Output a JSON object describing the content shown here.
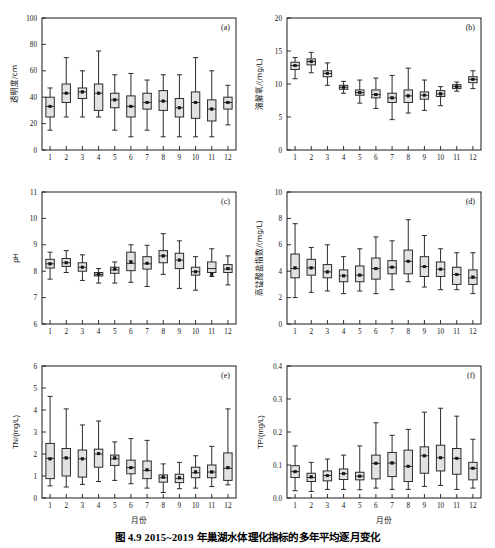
{
  "caption": "图 4.9   2015~2019 年巢湖水体理化指标的多年平均逐月变化",
  "common": {
    "xlabel": "月份",
    "categories": [
      "1",
      "2",
      "3",
      "4",
      "5",
      "6",
      "7",
      "8",
      "9",
      "10",
      "11",
      "12"
    ],
    "box_fill": "#e2e2e2",
    "box_stroke": "#2b2b2b",
    "mean_marker": "filled-square"
  },
  "chart_data": [
    {
      "type": "box",
      "panel": "(a)",
      "title": "",
      "xlabel": "月份",
      "ylabel": "透明度/cm",
      "ylim": [
        0,
        100
      ],
      "yticks": [
        0,
        20,
        40,
        60,
        80,
        100
      ],
      "grid": false,
      "categories": [
        "1",
        "2",
        "3",
        "4",
        "5",
        "6",
        "7",
        "8",
        "9",
        "10",
        "11",
        "12"
      ],
      "boxes": [
        {
          "month": "1",
          "whisker_low": 15,
          "q1": 25,
          "median": 33,
          "q3": 40,
          "whisker_high": 47,
          "mean": 33
        },
        {
          "month": "2",
          "whisker_low": 25,
          "q1": 36,
          "median": 43,
          "q3": 50,
          "whisker_high": 70,
          "mean": 43
        },
        {
          "month": "3",
          "whisker_low": 25,
          "q1": 39,
          "median": 44,
          "q3": 47,
          "whisker_high": 60,
          "mean": 44
        },
        {
          "month": "4",
          "whisker_low": 25,
          "q1": 30,
          "median": 43,
          "q3": 50,
          "whisker_high": 75,
          "mean": 43
        },
        {
          "month": "5",
          "whisker_low": 15,
          "q1": 32,
          "median": 38,
          "q3": 43,
          "whisker_high": 57,
          "mean": 38
        },
        {
          "month": "6",
          "whisker_low": 10,
          "q1": 25,
          "median": 33,
          "q3": 41,
          "whisker_high": 58,
          "mean": 33
        },
        {
          "month": "7",
          "whisker_low": 15,
          "q1": 31,
          "median": 36,
          "q3": 43,
          "whisker_high": 53,
          "mean": 36
        },
        {
          "month": "8",
          "whisker_low": 10,
          "q1": 30,
          "median": 37,
          "q3": 45,
          "whisker_high": 57,
          "mean": 37
        },
        {
          "month": "9",
          "whisker_low": 10,
          "q1": 25,
          "median": 32,
          "q3": 39,
          "whisker_high": 57,
          "mean": 32
        },
        {
          "month": "10",
          "whisker_low": 10,
          "q1": 24,
          "median": 36,
          "q3": 44,
          "whisker_high": 70,
          "mean": 36
        },
        {
          "month": "11",
          "whisker_low": 10,
          "q1": 22,
          "median": 31,
          "q3": 38,
          "whisker_high": 60,
          "mean": 31
        },
        {
          "month": "12",
          "whisker_low": 19,
          "q1": 31,
          "median": 36,
          "q3": 40,
          "whisker_high": 49,
          "mean": 36
        }
      ]
    },
    {
      "type": "box",
      "panel": "(b)",
      "title": "",
      "xlabel": "月份",
      "ylabel": "溶解氧/(mg/L)",
      "ylim": [
        0,
        20
      ],
      "yticks": [
        0,
        5,
        10,
        15,
        20
      ],
      "grid": false,
      "categories": [
        "1",
        "2",
        "3",
        "4",
        "5",
        "6",
        "7",
        "8",
        "9",
        "10",
        "11",
        "12"
      ],
      "boxes": [
        {
          "month": "1",
          "whisker_low": 10.8,
          "q1": 12.2,
          "median": 12.8,
          "q3": 13.3,
          "whisker_high": 14.0,
          "mean": 12.8
        },
        {
          "month": "2",
          "whisker_low": 11.7,
          "q1": 12.9,
          "median": 13.4,
          "q3": 13.8,
          "whisker_high": 14.8,
          "mean": 13.4
        },
        {
          "month": "3",
          "whisker_low": 9.8,
          "q1": 11.1,
          "median": 11.6,
          "q3": 12.0,
          "whisker_high": 13.2,
          "mean": 11.6
        },
        {
          "month": "4",
          "whisker_low": 8.6,
          "q1": 9.2,
          "median": 9.5,
          "q3": 9.8,
          "whisker_high": 10.4,
          "mean": 9.5
        },
        {
          "month": "5",
          "whisker_low": 7.1,
          "q1": 8.3,
          "median": 8.7,
          "q3": 9.1,
          "whisker_high": 10.6,
          "mean": 8.7
        },
        {
          "month": "6",
          "whisker_low": 6.3,
          "q1": 7.9,
          "median": 8.4,
          "q3": 9.1,
          "whisker_high": 10.9,
          "mean": 8.4
        },
        {
          "month": "7",
          "whisker_low": 4.6,
          "q1": 7.2,
          "median": 7.9,
          "q3": 8.6,
          "whisker_high": 11.3,
          "mean": 7.9
        },
        {
          "month": "8",
          "whisker_low": 5.6,
          "q1": 7.2,
          "median": 8.2,
          "q3": 9.1,
          "whisker_high": 12.4,
          "mean": 8.2
        },
        {
          "month": "9",
          "whisker_low": 6.0,
          "q1": 7.7,
          "median": 8.3,
          "q3": 8.8,
          "whisker_high": 10.6,
          "mean": 8.3
        },
        {
          "month": "10",
          "whisker_low": 6.7,
          "q1": 8.1,
          "median": 8.5,
          "q3": 9.0,
          "whisker_high": 9.6,
          "mean": 8.5
        },
        {
          "month": "11",
          "whisker_low": 8.9,
          "q1": 9.3,
          "median": 9.6,
          "q3": 9.9,
          "whisker_high": 10.3,
          "mean": 9.6
        },
        {
          "month": "12",
          "whisker_low": 9.3,
          "q1": 10.2,
          "median": 10.7,
          "q3": 11.1,
          "whisker_high": 12.0,
          "mean": 10.7
        }
      ]
    },
    {
      "type": "box",
      "panel": "(c)",
      "title": "",
      "xlabel": "月份",
      "ylabel": "pH",
      "ylim": [
        6,
        11
      ],
      "yticks": [
        6,
        7,
        8,
        9,
        10,
        11
      ],
      "grid": false,
      "categories": [
        "1",
        "2",
        "3",
        "4",
        "5",
        "6",
        "7",
        "8",
        "9",
        "10",
        "11",
        "12"
      ],
      "boxes": [
        {
          "month": "1",
          "whisker_low": 7.7,
          "q1": 8.12,
          "median": 8.28,
          "q3": 8.45,
          "whisker_high": 8.72,
          "mean": 8.28
        },
        {
          "month": "2",
          "whisker_low": 7.95,
          "q1": 8.18,
          "median": 8.32,
          "q3": 8.48,
          "whisker_high": 8.78,
          "mean": 8.32
        },
        {
          "month": "3",
          "whisker_low": 7.65,
          "q1": 8.0,
          "median": 8.15,
          "q3": 8.32,
          "whisker_high": 8.62,
          "mean": 8.15
        },
        {
          "month": "4",
          "whisker_low": 7.55,
          "q1": 7.82,
          "median": 7.88,
          "q3": 7.95,
          "whisker_high": 8.1,
          "mean": 7.88
        },
        {
          "month": "5",
          "whisker_low": 7.55,
          "q1": 7.92,
          "median": 8.05,
          "q3": 8.15,
          "whisker_high": 8.35,
          "mean": 8.08
        },
        {
          "month": "6",
          "whisker_low": 7.58,
          "q1": 8.02,
          "median": 8.3,
          "q3": 8.72,
          "whisker_high": 9.0,
          "mean": 8.35
        },
        {
          "month": "7",
          "whisker_low": 7.42,
          "q1": 8.08,
          "median": 8.28,
          "q3": 8.55,
          "whisker_high": 8.98,
          "mean": 8.3
        },
        {
          "month": "8",
          "whisker_low": 7.88,
          "q1": 8.32,
          "median": 8.58,
          "q3": 8.78,
          "whisker_high": 9.42,
          "mean": 8.58
        },
        {
          "month": "9",
          "whisker_low": 7.35,
          "q1": 8.1,
          "median": 8.42,
          "q3": 8.68,
          "whisker_high": 9.15,
          "mean": 8.42
        },
        {
          "month": "10",
          "whisker_low": 7.28,
          "q1": 7.85,
          "median": 7.98,
          "q3": 8.15,
          "whisker_high": 8.55,
          "mean": 7.98
        },
        {
          "month": "11",
          "whisker_low": 7.8,
          "q1": 7.95,
          "median": 8.1,
          "q3": 8.35,
          "whisker_high": 8.85,
          "mean": 7.88
        },
        {
          "month": "12",
          "whisker_low": 7.48,
          "q1": 7.95,
          "median": 8.08,
          "q3": 8.25,
          "whisker_high": 8.58,
          "mean": 8.1
        }
      ]
    },
    {
      "type": "box",
      "panel": "(d)",
      "title": "",
      "xlabel": "月份",
      "ylabel": "高锰酸盐指数/(mg/L)",
      "ylim": [
        0,
        10
      ],
      "yticks": [
        0,
        2,
        4,
        6,
        8,
        10
      ],
      "grid": false,
      "categories": [
        "1",
        "2",
        "3",
        "4",
        "5",
        "6",
        "7",
        "8",
        "9",
        "10",
        "11",
        "12"
      ],
      "boxes": [
        {
          "month": "1",
          "whisker_low": 2.0,
          "q1": 3.5,
          "median": 4.2,
          "q3": 5.3,
          "whisker_high": 7.6,
          "mean": 4.25
        },
        {
          "month": "2",
          "whisker_low": 2.4,
          "q1": 3.7,
          "median": 4.25,
          "q3": 4.9,
          "whisker_high": 5.8,
          "mean": 4.25
        },
        {
          "month": "3",
          "whisker_low": 2.5,
          "q1": 3.5,
          "median": 3.95,
          "q3": 4.5,
          "whisker_high": 6.0,
          "mean": 3.95
        },
        {
          "month": "4",
          "whisker_low": 2.3,
          "q1": 3.2,
          "median": 3.65,
          "q3": 4.1,
          "whisker_high": 5.1,
          "mean": 3.65
        },
        {
          "month": "5",
          "whisker_low": 2.5,
          "q1": 3.2,
          "median": 3.7,
          "q3": 4.4,
          "whisker_high": 5.7,
          "mean": 3.7
        },
        {
          "month": "6",
          "whisker_low": 2.3,
          "q1": 3.4,
          "median": 4.2,
          "q3": 5.0,
          "whisker_high": 6.6,
          "mean": 4.2
        },
        {
          "month": "7",
          "whisker_low": 2.6,
          "q1": 3.8,
          "median": 4.3,
          "q3": 4.8,
          "whisker_high": 6.3,
          "mean": 4.3
        },
        {
          "month": "8",
          "whisker_low": 3.2,
          "q1": 3.8,
          "median": 4.75,
          "q3": 5.6,
          "whisker_high": 7.9,
          "mean": 4.75
        },
        {
          "month": "9",
          "whisker_low": 2.8,
          "q1": 3.6,
          "median": 4.35,
          "q3": 5.1,
          "whisker_high": 6.7,
          "mean": 4.35
        },
        {
          "month": "10",
          "whisker_low": 2.6,
          "q1": 3.6,
          "median": 4.15,
          "q3": 4.7,
          "whisker_high": 5.7,
          "mean": 4.15
        },
        {
          "month": "11",
          "whisker_low": 2.6,
          "q1": 3.0,
          "median": 3.75,
          "q3": 4.3,
          "whisker_high": 5.4,
          "mean": 3.75
        },
        {
          "month": "12",
          "whisker_low": 2.3,
          "q1": 3.0,
          "median": 3.5,
          "q3": 4.1,
          "whisker_high": 5.4,
          "mean": 3.55
        }
      ]
    },
    {
      "type": "box",
      "panel": "(e)",
      "title": "",
      "xlabel": "月份",
      "ylabel": "TN/(mg/L)",
      "ylim": [
        0,
        6
      ],
      "yticks": [
        0,
        1,
        2,
        3,
        4,
        5,
        6
      ],
      "grid": false,
      "categories": [
        "1",
        "2",
        "3",
        "4",
        "5",
        "6",
        "7",
        "8",
        "9",
        "10",
        "11",
        "12"
      ],
      "boxes": [
        {
          "month": "1",
          "whisker_low": 0.55,
          "q1": 0.88,
          "median": 1.8,
          "q3": 2.48,
          "whisker_high": 4.62,
          "mean": 1.78
        },
        {
          "month": "2",
          "whisker_low": 0.5,
          "q1": 1.0,
          "median": 1.82,
          "q3": 2.25,
          "whisker_high": 4.05,
          "mean": 1.82
        },
        {
          "month": "3",
          "whisker_low": 0.62,
          "q1": 0.95,
          "median": 1.78,
          "q3": 2.18,
          "whisker_high": 3.32,
          "mean": 1.78
        },
        {
          "month": "4",
          "whisker_low": 0.75,
          "q1": 1.4,
          "median": 2.0,
          "q3": 2.22,
          "whisker_high": 3.5,
          "mean": 2.02
        },
        {
          "month": "5",
          "whisker_low": 0.8,
          "q1": 1.48,
          "median": 1.78,
          "q3": 1.95,
          "whisker_high": 2.55,
          "mean": 1.82
        },
        {
          "month": "6",
          "whisker_low": 0.65,
          "q1": 1.1,
          "median": 1.38,
          "q3": 1.72,
          "whisker_high": 2.7,
          "mean": 1.38
        },
        {
          "month": "7",
          "whisker_low": 0.45,
          "q1": 0.88,
          "median": 1.25,
          "q3": 1.68,
          "whisker_high": 2.62,
          "mean": 1.28
        },
        {
          "month": "8",
          "whisker_low": 0.25,
          "q1": 0.72,
          "median": 0.92,
          "q3": 1.05,
          "whisker_high": 1.55,
          "mean": 0.95
        },
        {
          "month": "9",
          "whisker_low": 0.42,
          "q1": 0.7,
          "median": 0.88,
          "q3": 1.08,
          "whisker_high": 1.62,
          "mean": 0.92
        },
        {
          "month": "10",
          "whisker_low": 0.45,
          "q1": 0.92,
          "median": 1.15,
          "q3": 1.4,
          "whisker_high": 1.92,
          "mean": 1.18
        },
        {
          "month": "11",
          "whisker_low": 0.52,
          "q1": 0.92,
          "median": 1.18,
          "q3": 1.5,
          "whisker_high": 2.35,
          "mean": 1.18
        },
        {
          "month": "12",
          "whisker_low": 0.6,
          "q1": 0.8,
          "median": 1.35,
          "q3": 2.05,
          "whisker_high": 4.05,
          "mean": 1.38
        }
      ]
    },
    {
      "type": "box",
      "panel": "(f)",
      "title": "",
      "xlabel": "月份",
      "ylabel": "TP/(mg/L)",
      "ylim": [
        0.0,
        0.4
      ],
      "yticks": [
        0.0,
        0.1,
        0.2,
        0.3,
        0.4
      ],
      "grid": false,
      "categories": [
        "1",
        "2",
        "3",
        "4",
        "5",
        "6",
        "7",
        "8",
        "9",
        "10",
        "11",
        "12"
      ],
      "boxes": [
        {
          "month": "1",
          "whisker_low": 0.022,
          "q1": 0.062,
          "median": 0.08,
          "q3": 0.098,
          "whisker_high": 0.158,
          "mean": 0.08
        },
        {
          "month": "2",
          "whisker_low": 0.02,
          "q1": 0.05,
          "median": 0.062,
          "q3": 0.075,
          "whisker_high": 0.108,
          "mean": 0.064
        },
        {
          "month": "3",
          "whisker_low": 0.026,
          "q1": 0.052,
          "median": 0.068,
          "q3": 0.082,
          "whisker_high": 0.118,
          "mean": 0.068
        },
        {
          "month": "4",
          "whisker_low": 0.026,
          "q1": 0.056,
          "median": 0.074,
          "q3": 0.088,
          "whisker_high": 0.13,
          "mean": 0.074
        },
        {
          "month": "5",
          "whisker_low": 0.025,
          "q1": 0.055,
          "median": 0.066,
          "q3": 0.078,
          "whisker_high": 0.158,
          "mean": 0.066
        },
        {
          "month": "6",
          "whisker_low": 0.03,
          "q1": 0.058,
          "median": 0.105,
          "q3": 0.13,
          "whisker_high": 0.228,
          "mean": 0.105
        },
        {
          "month": "7",
          "whisker_low": 0.026,
          "q1": 0.065,
          "median": 0.106,
          "q3": 0.138,
          "whisker_high": 0.19,
          "mean": 0.106
        },
        {
          "month": "8",
          "whisker_low": 0.026,
          "q1": 0.05,
          "median": 0.096,
          "q3": 0.145,
          "whisker_high": 0.208,
          "mean": 0.096
        },
        {
          "month": "9",
          "whisker_low": 0.035,
          "q1": 0.075,
          "median": 0.128,
          "q3": 0.155,
          "whisker_high": 0.26,
          "mean": 0.128
        },
        {
          "month": "10",
          "whisker_low": 0.038,
          "q1": 0.082,
          "median": 0.122,
          "q3": 0.16,
          "whisker_high": 0.272,
          "mean": 0.122
        },
        {
          "month": "11",
          "whisker_low": 0.026,
          "q1": 0.072,
          "median": 0.12,
          "q3": 0.15,
          "whisker_high": 0.248,
          "mean": 0.12
        },
        {
          "month": "12",
          "whisker_low": 0.03,
          "q1": 0.055,
          "median": 0.09,
          "q3": 0.108,
          "whisker_high": 0.178,
          "mean": 0.09
        }
      ]
    }
  ]
}
